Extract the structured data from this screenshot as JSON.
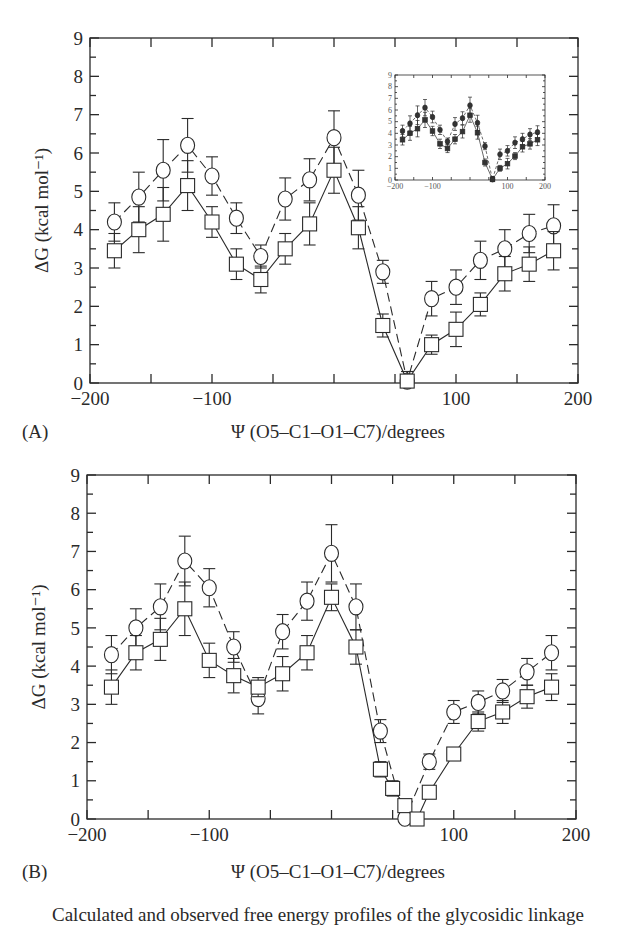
{
  "chart_data": [
    {
      "panel": "(A)",
      "type": "line",
      "title": "",
      "xlabel": "Ψ (O5–C1–O1–C7)/degrees",
      "ylabel": "ΔG (kcal mol⁻¹)",
      "xlim": [
        -200,
        200
      ],
      "ylim": [
        0,
        9
      ],
      "xticks": [
        -200,
        -100,
        100,
        200
      ],
      "yticks": [
        0,
        1,
        2,
        3,
        4,
        5,
        6,
        7,
        8,
        9
      ],
      "grid": false,
      "series": [
        {
          "name": "circles (dashed)",
          "marker": "circle",
          "line": "dashed",
          "x": [
            -180,
            -160,
            -140,
            -120,
            -100,
            -80,
            -60,
            -40,
            -20,
            0,
            20,
            40,
            60,
            80,
            100,
            120,
            140,
            160,
            180
          ],
          "values": [
            4.2,
            4.85,
            5.55,
            6.2,
            5.4,
            4.3,
            3.3,
            4.8,
            5.3,
            6.4,
            4.9,
            2.9,
            0.05,
            2.2,
            2.5,
            3.2,
            3.5,
            3.9,
            4.1
          ],
          "errors": [
            0.5,
            0.65,
            0.8,
            0.7,
            0.5,
            0.4,
            0.3,
            0.55,
            0.55,
            0.7,
            0.65,
            0.3,
            0.25,
            0.45,
            0.45,
            0.5,
            0.5,
            0.5,
            0.55
          ]
        },
        {
          "name": "squares (solid)",
          "marker": "square",
          "line": "solid",
          "x": [
            -180,
            -160,
            -140,
            -120,
            -100,
            -80,
            -60,
            -40,
            -20,
            0,
            20,
            40,
            60,
            80,
            100,
            120,
            140,
            160,
            180
          ],
          "values": [
            3.45,
            4.0,
            4.4,
            5.15,
            4.2,
            3.1,
            2.7,
            3.5,
            4.15,
            5.55,
            4.05,
            1.5,
            0.05,
            1.0,
            1.4,
            2.05,
            2.85,
            3.1,
            3.45
          ],
          "errors": [
            0.45,
            0.6,
            0.7,
            0.65,
            0.4,
            0.4,
            0.35,
            0.4,
            0.55,
            0.6,
            0.55,
            0.3,
            0.25,
            0.25,
            0.45,
            0.3,
            0.45,
            0.45,
            0.5
          ]
        }
      ],
      "inset": {
        "xlim": [
          -200,
          200
        ],
        "ylim": [
          0,
          9
        ],
        "xticks": [
          -200,
          -100,
          100,
          200
        ],
        "yticks": [
          0,
          1,
          2,
          3,
          4,
          5,
          6,
          7,
          8,
          9
        ],
        "note": "miniature of the same two series with filled markers"
      }
    },
    {
      "panel": "(B)",
      "type": "line",
      "title": "",
      "xlabel": "Ψ (O5–C1–O1–C7)/degrees",
      "ylabel": "ΔG (kcal mol⁻¹)",
      "xlim": [
        -200,
        200
      ],
      "ylim": [
        0,
        9
      ],
      "xticks": [
        -200,
        -100,
        100,
        200
      ],
      "yticks": [
        0,
        1,
        2,
        3,
        4,
        5,
        6,
        7,
        8,
        9
      ],
      "grid": false,
      "series": [
        {
          "name": "circles (dashed)",
          "marker": "circle",
          "line": "dashed",
          "x": [
            -180,
            -160,
            -140,
            -120,
            -100,
            -80,
            -60,
            -40,
            -20,
            0,
            20,
            40,
            60,
            80,
            100,
            120,
            140,
            160,
            180
          ],
          "values": [
            4.3,
            5.0,
            5.55,
            6.75,
            6.05,
            4.5,
            3.15,
            4.9,
            5.7,
            6.95,
            5.55,
            2.3,
            0.02,
            1.5,
            2.8,
            3.05,
            3.35,
            3.85,
            4.35
          ],
          "errors": [
            0.5,
            0.5,
            0.6,
            0.65,
            0.5,
            0.4,
            0.4,
            0.45,
            0.5,
            0.75,
            0.6,
            0.3,
            0.05,
            0.2,
            0.3,
            0.3,
            0.3,
            0.35,
            0.45
          ]
        },
        {
          "name": "squares (solid)",
          "marker": "square",
          "line": "solid",
          "x": [
            -180,
            -160,
            -140,
            -120,
            -100,
            -80,
            -60,
            -40,
            -20,
            0,
            20,
            40,
            50,
            60,
            70,
            80,
            100,
            120,
            140,
            160,
            180
          ],
          "values": [
            3.45,
            4.35,
            4.7,
            5.5,
            4.15,
            3.75,
            3.45,
            3.8,
            4.35,
            5.8,
            4.5,
            1.3,
            0.8,
            0.35,
            0.0,
            0.7,
            1.7,
            2.55,
            2.8,
            3.2,
            3.45
          ],
          "errors": [
            0.45,
            0.45,
            0.55,
            0.7,
            0.45,
            0.45,
            0.25,
            0.45,
            0.45,
            0.35,
            0.45,
            0.2,
            0.2,
            0.1,
            0.05,
            0.1,
            0.1,
            0.25,
            0.3,
            0.3,
            0.35
          ]
        }
      ]
    }
  ],
  "caption_partial": "Calculated and observed free energy profiles of the glycosidic linkage"
}
